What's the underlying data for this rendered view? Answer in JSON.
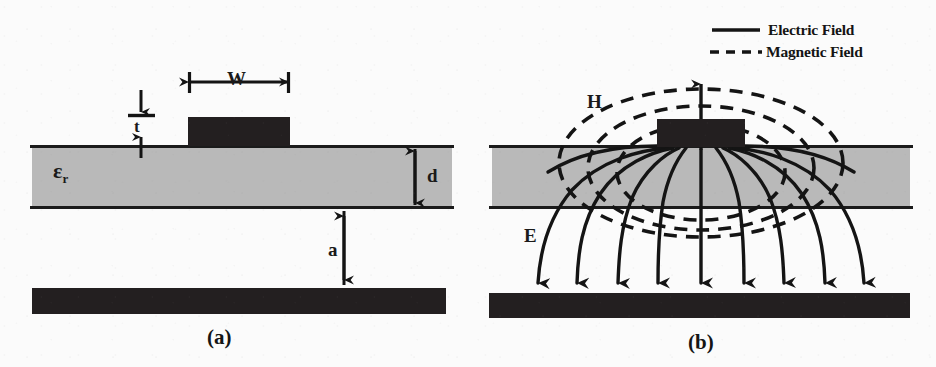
{
  "figure": {
    "background_color": "#fbfbfb",
    "substrate_color": "#b9b9b9",
    "conductor_color": "#231f20",
    "line_color": "#141414"
  },
  "panels": [
    {
      "id": "a",
      "caption": "(a)",
      "description": "Microstrip geometry with labelled dimensions",
      "labels": [
        {
          "name": "strip-width",
          "text": "W",
          "meaning": "strip conductor width"
        },
        {
          "name": "strip-thickness",
          "text": "t",
          "meaning": "strip conductor thickness"
        },
        {
          "name": "relative-permittivity",
          "text": "ε",
          "subscript": "r",
          "meaning": "substrate relative permittivity"
        },
        {
          "name": "substrate-height",
          "text": "d",
          "meaning": "substrate thickness"
        },
        {
          "name": "air-gap",
          "text": "a",
          "meaning": "air gap between substrate and ground plane"
        }
      ]
    },
    {
      "id": "b",
      "caption": "(b)",
      "description": "Electric and magnetic field distribution of the microstrip line",
      "labels": [
        {
          "name": "magnetic-field-label",
          "text": "H",
          "meaning": "magnetic field"
        },
        {
          "name": "electric-field-label",
          "text": "E",
          "meaning": "electric field"
        }
      ],
      "electric_field_arrow_count": 9,
      "magnetic_field_loop_count": 3
    }
  ],
  "legend": {
    "position": "top-right",
    "items": [
      {
        "name": "electric-field",
        "label": "Electric Field",
        "style": "solid"
      },
      {
        "name": "magnetic-field",
        "label": "Magnetic Field",
        "style": "dashed"
      }
    ]
  }
}
